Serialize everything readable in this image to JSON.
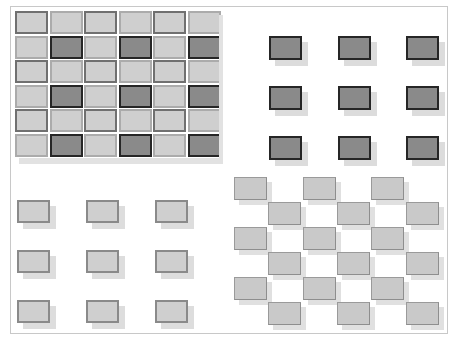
{
  "figure": {
    "colors": {
      "light_fill": "#cfcfcf",
      "dark_fill": "#8a8a8a",
      "dark_border": "#262626",
      "light_border": "#8a8a8a",
      "shadow": "#dddddd",
      "frame": "#c8c8c8"
    },
    "panels": [
      {
        "id": "top-left",
        "type": "dense-checker-grid",
        "rows": 6,
        "cols": 6,
        "origin": [
          15,
          11
        ],
        "stride": [
          34.5,
          24.6
        ],
        "cell_size": [
          33,
          23
        ],
        "dark_cells": "odd rows, odd cols"
      },
      {
        "id": "top-right",
        "type": "sparse-grid",
        "rows": 3,
        "cols": 3,
        "origin": [
          269,
          36
        ],
        "stride": [
          68.5,
          50
        ],
        "cell_size": [
          33,
          24
        ],
        "shade": "dark"
      },
      {
        "id": "bottom-left",
        "type": "sparse-grid",
        "rows": 3,
        "cols": 3,
        "origin": [
          17,
          200
        ],
        "stride": [
          69,
          50
        ],
        "cell_size": [
          33,
          23
        ],
        "shade": "light"
      },
      {
        "id": "bottom-right",
        "type": "staggered-grid",
        "rows": 6,
        "origin": [
          234,
          177
        ],
        "col_stride": 34.3,
        "row_stride": 25,
        "cell_size": [
          33,
          23
        ],
        "shade": "light"
      }
    ]
  }
}
